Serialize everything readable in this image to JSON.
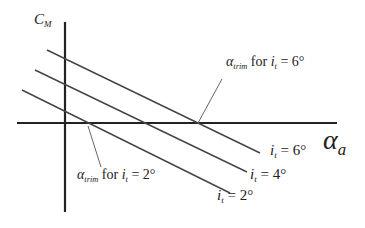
{
  "diagram": {
    "y_axis_label": {
      "main": "C",
      "sub": "M"
    },
    "x_axis_label": {
      "main": "α",
      "sub": "a"
    },
    "lines": [
      {
        "name": "i_t = 2°",
        "label_main": "i",
        "label_sub": "t",
        "label_rest": " = 2°"
      },
      {
        "name": "i_t = 4°",
        "label_main": "i",
        "label_sub": "t",
        "label_rest": " = 4°"
      },
      {
        "name": "i_t = 6°",
        "label_main": "i",
        "label_sub": "t",
        "label_rest": " = 6°"
      }
    ],
    "annotations": [
      {
        "id": "trim6",
        "alpha": "α",
        "alpha_sub": "trim",
        "for_text": " for ",
        "i": "i",
        "i_sub": "t",
        "rest": " = 6°"
      },
      {
        "id": "trim2",
        "alpha": "α",
        "alpha_sub": "trim",
        "for_text": " for ",
        "i": "i",
        "i_sub": "t",
        "rest": " = 2°"
      }
    ],
    "colors": {
      "axis": "#222222",
      "line": "#444444",
      "leader": "#666666"
    }
  }
}
